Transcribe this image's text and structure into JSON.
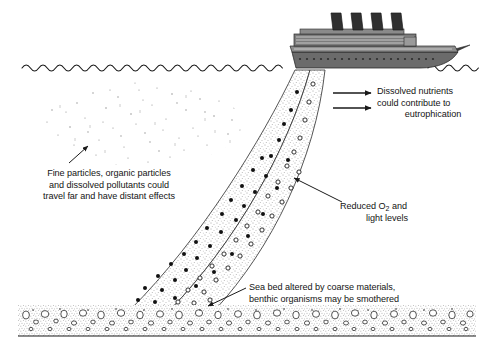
{
  "diagram": {
    "background_color": "#ffffff",
    "ink_color": "#1a1a1a",
    "ship": {
      "name": "ocean-liner",
      "funnel_count": 4,
      "hull_color": "#6e6e6e",
      "funnel_color": "#3a3a3a",
      "deck_color": "#9a9a9a"
    },
    "sea_surface": {
      "name": "wavy-water-line",
      "style": "scalloped-arcs"
    },
    "sea_bed": {
      "name": "gravel-sea-bed",
      "style": "stippled-band-with-pebbles"
    },
    "plume": {
      "name": "sediment-plume",
      "bands": [
        {
          "name": "coarse-particle-band",
          "marker": "filled-dot"
        },
        {
          "name": "fine-particle-band",
          "marker": "open-circle"
        }
      ]
    },
    "particle_cloud": {
      "name": "fine-particle-cloud",
      "style": "sparse-stipple"
    }
  },
  "labels": {
    "fine_particles": {
      "name": "label-fine-particles",
      "line1": "Fine particles, organic particles",
      "line2": "and dissolved pollutants could",
      "line3": "travel far and have distant effects"
    },
    "dissolved_nutrients": {
      "name": "label-dissolved-nutrients",
      "line1": "Dissolved nutrients",
      "line2": "could contribute to",
      "line3": "eutrophication"
    },
    "reduced_oxygen": {
      "name": "label-reduced-oxygen",
      "line1_prefix": "Reduced O",
      "line1_subscript": "2",
      "line1_suffix": " and",
      "line2": "light levels"
    },
    "sea_bed": {
      "name": "label-sea-bed",
      "line1": "Sea bed altered by coarse materials,",
      "line2": "benthic organisms may be smothered"
    }
  },
  "arrows": [
    {
      "name": "arrow-nutrients-upper",
      "direction": "right"
    },
    {
      "name": "arrow-nutrients-lower",
      "direction": "right"
    },
    {
      "name": "arrow-fine-particles",
      "direction": "up-left"
    },
    {
      "name": "arrow-reduced-oxygen",
      "direction": "up-left"
    },
    {
      "name": "arrow-sea-bed",
      "direction": "down-left"
    }
  ]
}
